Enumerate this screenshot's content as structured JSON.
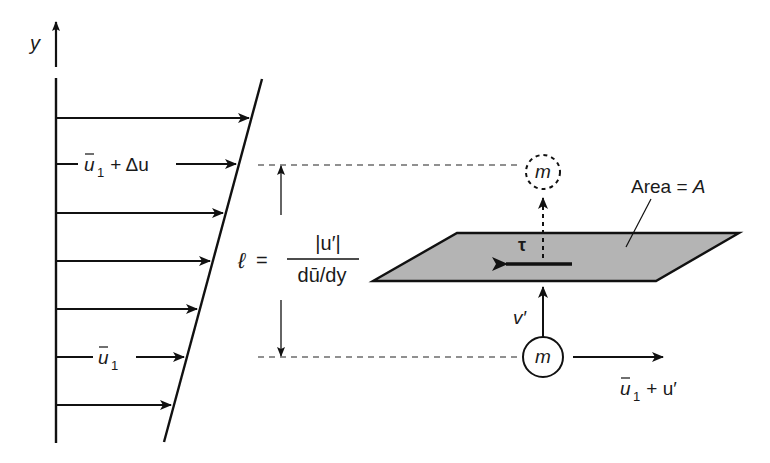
{
  "diagram": {
    "colors": {
      "ink": "#111111",
      "plane_fill": "#b4b4b4",
      "background": "#ffffff"
    },
    "axis": {
      "label": "y"
    },
    "velocity_profile": {
      "arrow_count": 7,
      "labels": {
        "upper": {
          "base": "u",
          "bar": true,
          "subscript": "1",
          "suffix": " + Δu"
        },
        "lower": {
          "base": "u",
          "bar": true,
          "subscript": "1"
        }
      }
    },
    "mixing_length": {
      "symbol": "ℓ",
      "equals": "=",
      "numerator": "|u′|",
      "denominator": "dū/dy"
    },
    "plane": {
      "label_prefix": "Area = ",
      "label_var": "A",
      "shear_symbol": "τ"
    },
    "parcel": {
      "symbol": "m",
      "vertical_velocity": "v′",
      "horizontal_velocity": {
        "base": "u",
        "subscript": "1",
        "suffix": " + u′"
      }
    }
  }
}
